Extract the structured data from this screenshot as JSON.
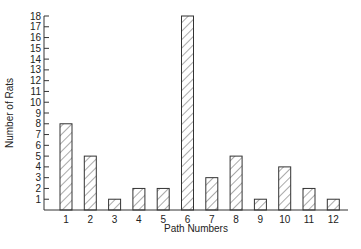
{
  "chart_data": {
    "type": "bar",
    "title": "",
    "xlabel": "Path Numbers",
    "ylabel": "Number of Rats",
    "categories": [
      "1",
      "2",
      "3",
      "4",
      "5",
      "6",
      "7",
      "8",
      "9",
      "10",
      "11",
      "12"
    ],
    "values": [
      8,
      5,
      1,
      2,
      2,
      18,
      3,
      5,
      1,
      4,
      2,
      1
    ],
    "ylim": [
      0,
      18
    ],
    "yticks": [
      1,
      2,
      3,
      4,
      5,
      6,
      7,
      8,
      9,
      10,
      11,
      12,
      13,
      14,
      15,
      16,
      17,
      18
    ],
    "grid": false,
    "legend": null,
    "bar_fill": "diagonal-hatch",
    "colors": {
      "stroke": "#333333",
      "hatch": "#555555",
      "background": "#ffffff"
    }
  }
}
